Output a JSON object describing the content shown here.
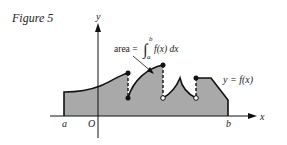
{
  "figure": {
    "caption": "Figure 5",
    "axis_x_label": "x",
    "axis_y_label": "y",
    "origin_label": "O",
    "a_label": "a",
    "b_label": "b",
    "curve_label": "y = f(x)",
    "area_label_prefix": "area = ",
    "integral_upper": "b",
    "integral_lower": "a",
    "integrand": "f(x) dx",
    "colors": {
      "fill": "#a9a9a9",
      "stroke": "#111111",
      "background": "#ffffff"
    }
  }
}
